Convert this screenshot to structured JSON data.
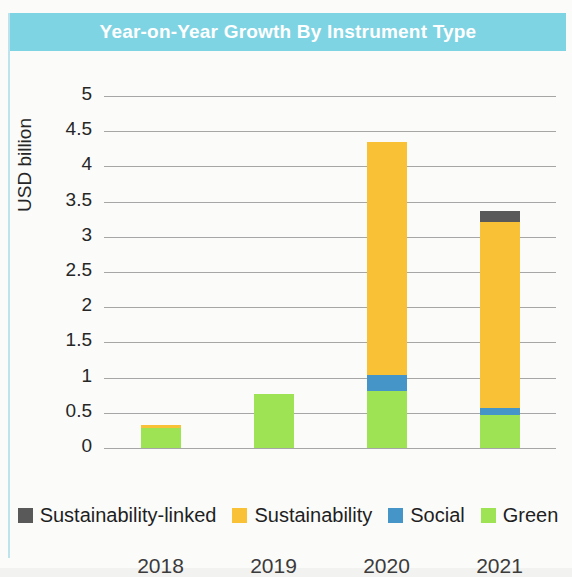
{
  "header": {
    "title": "Year-on-Year Growth By Instrument Type"
  },
  "colors": {
    "banner": "#7fd4e3",
    "left_rule": "#bfe3ec",
    "sustainability_linked": "#595959",
    "sustainability": "#f9c236",
    "social": "#4595c8",
    "green": "#9ee353",
    "gridline": "#a6a6a6",
    "text": "#262626"
  },
  "axes": {
    "y_title": "USD billion",
    "y_ticks": [
      "5",
      "4.5",
      "4",
      "3.5",
      "3",
      "2.5",
      "2",
      "1.5",
      "1",
      "0.5",
      "0"
    ],
    "x_ticks": [
      "2018",
      "2019",
      "2020",
      "2021"
    ]
  },
  "legend": {
    "items": [
      {
        "label": "Sustainability-linked",
        "color": "#595959",
        "swatch_name": "legend-swatch-sustainability-linked"
      },
      {
        "label": "Sustainability",
        "color": "#f9c236",
        "swatch_name": "legend-swatch-sustainability"
      },
      {
        "label": "Social",
        "color": "#4595c8",
        "swatch_name": "legend-swatch-social"
      },
      {
        "label": "Green",
        "color": "#9ee353",
        "swatch_name": "legend-swatch-green"
      }
    ]
  },
  "chart_data": {
    "type": "bar",
    "subtype": "stacked",
    "title": "Year-on-Year Growth By Instrument Type",
    "xlabel": "",
    "ylabel": "USD billion",
    "categories": [
      "2018",
      "2019",
      "2020",
      "2021"
    ],
    "ylim": [
      0,
      5
    ],
    "ytick_step": 0.5,
    "grid": true,
    "legend_position": "bottom",
    "series": [
      {
        "name": "Green",
        "color": "#9ee353",
        "values": [
          0.28,
          0.77,
          0.81,
          0.47
        ]
      },
      {
        "name": "Social",
        "color": "#4595c8",
        "values": [
          0,
          0,
          0.22,
          0.1
        ]
      },
      {
        "name": "Sustainability",
        "color": "#f9c236",
        "values": [
          0.05,
          0,
          3.32,
          2.64
        ]
      },
      {
        "name": "Sustainability-linked",
        "color": "#595959",
        "values": [
          0,
          0,
          0,
          0.16
        ]
      }
    ],
    "totals": [
      0.33,
      0.77,
      4.35,
      3.37
    ]
  }
}
